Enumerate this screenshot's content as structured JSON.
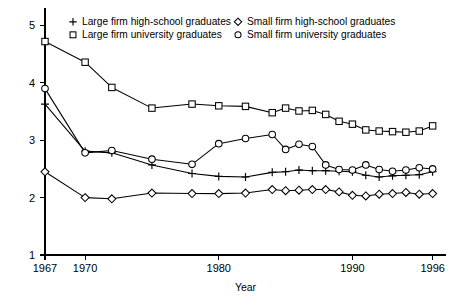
{
  "chart_data": {
    "type": "line",
    "title": "",
    "xlabel": "Year",
    "ylabel": "",
    "xlim": [
      1967,
      1997
    ],
    "ylim": [
      1,
      5.2
    ],
    "grid": false,
    "legend_position": "top-inside",
    "x": [
      1967,
      1970,
      1972,
      1975,
      1978,
      1980,
      1982,
      1984,
      1985,
      1986,
      1987,
      1988,
      1989,
      1990,
      1991,
      1992,
      1993,
      1994,
      1995,
      1996
    ],
    "xticks": [
      1967,
      1970,
      1980,
      1990,
      1996
    ],
    "xticklabels": [
      "1967",
      "1970",
      "1980",
      "1990",
      "1996"
    ],
    "yticks": [
      1,
      2,
      3,
      4,
      5
    ],
    "yticklabels": [
      "1",
      "2",
      "3",
      "4",
      "5"
    ],
    "series": [
      {
        "name": "Large firm high-school graduates",
        "marker": "plus",
        "values": [
          3.63,
          2.81,
          2.78,
          2.57,
          2.42,
          2.37,
          2.36,
          2.44,
          2.45,
          2.48,
          2.47,
          2.47,
          2.46,
          2.45,
          2.39,
          2.36,
          2.38,
          2.39,
          2.4,
          2.45
        ]
      },
      {
        "name": "Large firm university graduates",
        "marker": "square",
        "values": [
          4.72,
          4.36,
          3.92,
          3.56,
          3.63,
          3.6,
          3.59,
          3.48,
          3.56,
          3.51,
          3.52,
          3.45,
          3.33,
          3.28,
          3.18,
          3.16,
          3.15,
          3.14,
          3.16,
          3.25
        ]
      },
      {
        "name": "Small firm high-school graduates",
        "marker": "diamond",
        "values": [
          2.45,
          2.0,
          1.98,
          2.08,
          2.07,
          2.07,
          2.08,
          2.14,
          2.12,
          2.13,
          2.14,
          2.14,
          2.1,
          2.04,
          2.03,
          2.06,
          2.07,
          2.09,
          2.06,
          2.07
        ]
      },
      {
        "name": "Small firm university graduates",
        "marker": "circle",
        "values": [
          3.9,
          2.78,
          2.82,
          2.67,
          2.58,
          2.94,
          3.03,
          3.1,
          2.84,
          2.93,
          2.89,
          2.57,
          2.49,
          2.48,
          2.57,
          2.49,
          2.46,
          2.48,
          2.52,
          2.5
        ]
      }
    ],
    "legend": [
      {
        "marker": "plus",
        "label": "Large firm high-school graduates"
      },
      {
        "marker": "square",
        "label": "Large firm university graduates"
      },
      {
        "marker": "diamond",
        "label": "Small firm high-school graduates"
      },
      {
        "marker": "circle",
        "label": "Small firm university graduates"
      }
    ]
  },
  "colors": {
    "line": "#000000",
    "marker_fill": "#ffffff",
    "background": "#ffffff"
  }
}
